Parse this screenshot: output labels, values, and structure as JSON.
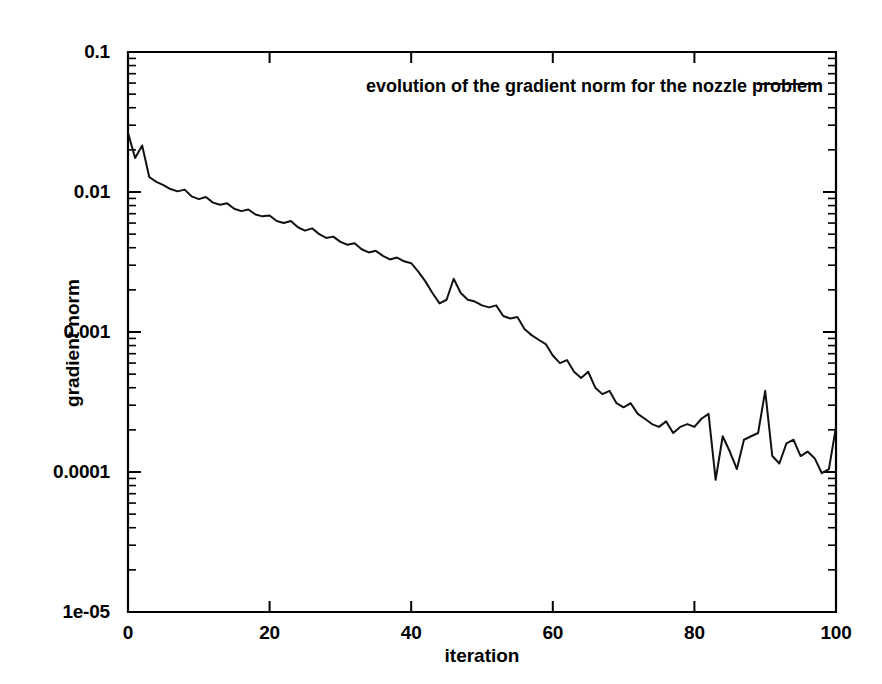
{
  "chart_data": {
    "type": "line",
    "title": "",
    "xlabel": "iteration",
    "ylabel": "gradient norm",
    "yscale": "log",
    "xscale": "linear",
    "xlim": [
      0,
      100
    ],
    "ylim": [
      1e-05,
      0.1
    ],
    "grid": false,
    "legend_position": "top-right-inside",
    "xticks": [
      "0",
      "20",
      "40",
      "60",
      "80",
      "100"
    ],
    "xtick_values": [
      0,
      20,
      40,
      60,
      80,
      100
    ],
    "yticks": [
      "1e-05",
      "0.0001",
      "0.001",
      "0.01",
      "0.1"
    ],
    "ytick_values": [
      1e-05,
      0.0001,
      0.001,
      0.01,
      0.1
    ],
    "series": [
      {
        "name": "evolution of the gradient norm for the nozzle problem",
        "color": "#111111",
        "x": [
          0,
          1,
          2,
          3,
          4,
          5,
          6,
          7,
          8,
          9,
          10,
          11,
          12,
          13,
          14,
          15,
          16,
          17,
          18,
          19,
          20,
          21,
          22,
          23,
          24,
          25,
          26,
          27,
          28,
          29,
          30,
          31,
          32,
          33,
          34,
          35,
          36,
          37,
          38,
          39,
          40,
          41,
          42,
          43,
          44,
          45,
          46,
          47,
          48,
          49,
          50,
          51,
          52,
          53,
          54,
          55,
          56,
          57,
          58,
          59,
          60,
          61,
          62,
          63,
          64,
          65,
          66,
          67,
          68,
          69,
          70,
          71,
          72,
          73,
          74,
          75,
          76,
          77,
          78,
          79,
          80,
          81,
          82,
          83,
          84,
          85,
          86,
          87,
          88,
          89,
          90,
          91,
          92,
          93,
          94,
          95,
          96,
          97,
          98,
          99,
          100
        ],
        "y": [
          0.0265,
          0.0175,
          0.0215,
          0.0128,
          0.0118,
          0.0112,
          0.0105,
          0.0101,
          0.0104,
          0.0093,
          0.0089,
          0.0092,
          0.0084,
          0.0081,
          0.0083,
          0.0076,
          0.0073,
          0.0075,
          0.0069,
          0.0067,
          0.0068,
          0.0062,
          0.006,
          0.0062,
          0.0056,
          0.0053,
          0.0055,
          0.005,
          0.0047,
          0.0048,
          0.0044,
          0.0042,
          0.0043,
          0.0039,
          0.0037,
          0.0038,
          0.0035,
          0.0033,
          0.0034,
          0.0032,
          0.0031,
          0.0027,
          0.0023,
          0.0019,
          0.0016,
          0.0017,
          0.0024,
          0.0019,
          0.0017,
          0.00165,
          0.00155,
          0.0015,
          0.00155,
          0.0013,
          0.00125,
          0.00128,
          0.00105,
          0.00095,
          0.00088,
          0.00082,
          0.00068,
          0.0006,
          0.00063,
          0.00052,
          0.00047,
          0.00052,
          0.0004,
          0.00036,
          0.00038,
          0.00031,
          0.00029,
          0.00031,
          0.00026,
          0.00024,
          0.00022,
          0.00021,
          0.00023,
          0.00019,
          0.00021,
          0.00022,
          0.00021,
          0.00024,
          0.00026,
          8.8e-05,
          0.00018,
          0.00014,
          0.000105,
          0.00017,
          0.00018,
          0.00019,
          0.00038,
          0.00013,
          0.000115,
          0.00016,
          0.00017,
          0.00013,
          0.00014,
          0.000125,
          9.8e-05,
          0.000105,
          0.00021
        ]
      }
    ]
  },
  "legend": {
    "label": "evolution of the gradient norm for the nozzle problem"
  },
  "axes": {
    "x_label": "iteration",
    "y_label": "gradient norm",
    "x_tick_labels": [
      "0",
      "20",
      "40",
      "60",
      "80",
      "100"
    ],
    "y_tick_labels": [
      "0.1",
      "0.01",
      "0.001",
      "0.0001",
      "1e-05"
    ]
  },
  "colors": {
    "line": "#111111",
    "axis": "#000000",
    "background": "#ffffff"
  }
}
